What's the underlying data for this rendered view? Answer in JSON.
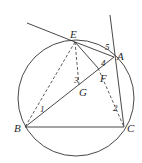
{
  "diagram": {
    "type": "geometry",
    "circle": {
      "cx": 76,
      "cy": 98,
      "r": 58
    },
    "points": {
      "E": {
        "label": "E",
        "x": 75,
        "y": 42
      },
      "A": {
        "label": "A",
        "x": 114,
        "y": 57
      },
      "B": {
        "label": "B",
        "x": 25,
        "y": 127
      },
      "C": {
        "label": "C",
        "x": 124,
        "y": 127
      },
      "F": {
        "label": "F",
        "x": 98,
        "y": 72
      },
      "G": {
        "label": "G",
        "x": 80,
        "y": 84
      }
    },
    "angle_labels": [
      "1",
      "2",
      "3",
      "4",
      "5"
    ],
    "colors": {
      "stroke": "#333333",
      "text": "#2a2a2a"
    }
  }
}
